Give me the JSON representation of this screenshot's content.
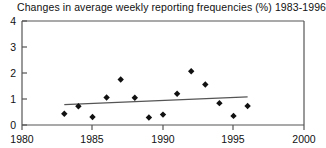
{
  "chart_data": {
    "type": "scatter",
    "title": "Changes in average weekly reporting frequencies (%) 1983-1996",
    "xlabel": "",
    "ylabel": "",
    "xlim": [
      1980,
      2000
    ],
    "ylim": [
      0,
      4
    ],
    "xticks": [
      1980,
      1985,
      1990,
      1995,
      2000
    ],
    "yticks": [
      0,
      1,
      2,
      3,
      4
    ],
    "grid": false,
    "legend": "none",
    "marker": "diamond",
    "marker_color": "#111111",
    "series": [
      {
        "name": "Changes in average weekly reporting frequencies",
        "x": [
          1983,
          1984,
          1985,
          1986,
          1987,
          1988,
          1989,
          1990,
          1991,
          1992,
          1993,
          1994,
          1995,
          1996
        ],
        "values": [
          0.43,
          0.72,
          0.31,
          1.06,
          1.75,
          1.05,
          0.29,
          0.4,
          1.2,
          2.07,
          1.56,
          0.84,
          0.35,
          0.73
        ]
      },
      {
        "name": "trend-line",
        "x": [
          1983,
          1996
        ],
        "values": [
          0.78,
          1.08
        ],
        "type": "line",
        "color": "#555555"
      }
    ]
  },
  "axes": {
    "x_tick_labels": [
      "1980",
      "1985",
      "1990",
      "1995",
      "2000"
    ],
    "y_tick_labels": [
      "0",
      "1",
      "2",
      "3",
      "4"
    ]
  }
}
